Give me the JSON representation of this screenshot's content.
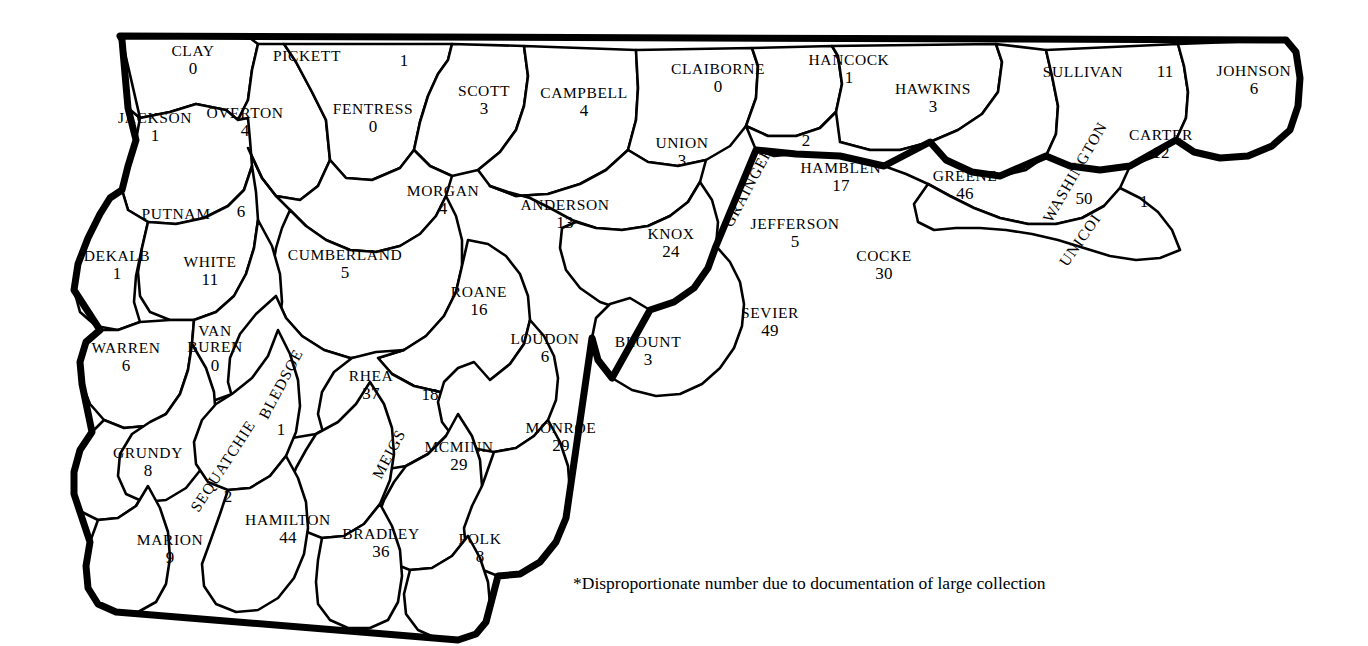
{
  "map": {
    "title_visible": false,
    "region": "East and Middle Tennessee counties",
    "footnote": "*Disproportionate number due to documentation of large collection",
    "colors": {
      "outline": "#000000",
      "county_border": "#000000",
      "fill": "#ffffff",
      "text": "#000000"
    },
    "counties": [
      {
        "name": "CLAY",
        "count": "0",
        "x": 193,
        "y": 60,
        "cx": 193,
        "cy": 83,
        "rotate": 0
      },
      {
        "name": "PICKETT",
        "count": "1",
        "x": 307,
        "y": 56,
        "cx": 404,
        "cy": 61,
        "rotate": 0,
        "split": true
      },
      {
        "name": "JACKSON",
        "count": "1",
        "x": 155,
        "y": 127,
        "cx": 155,
        "cy": 150,
        "rotate": 0
      },
      {
        "name": "OVERTON",
        "count": "4",
        "x": 245,
        "y": 122,
        "cx": 245,
        "cy": 145,
        "rotate": 0
      },
      {
        "name": "FENTRESS",
        "count": "0",
        "x": 373,
        "y": 118,
        "cx": 373,
        "cy": 141,
        "rotate": 0
      },
      {
        "name": "SCOTT",
        "count": "3",
        "x": 484,
        "y": 100,
        "cx": 484,
        "cy": 123,
        "rotate": 0
      },
      {
        "name": "CAMPBELL",
        "count": "4",
        "x": 584,
        "y": 102,
        "cx": 584,
        "cy": 125,
        "rotate": 0
      },
      {
        "name": "CLAIBORNE",
        "count": "0",
        "x": 718,
        "y": 78,
        "cx": 718,
        "cy": 101,
        "rotate": 0
      },
      {
        "name": "HANCOCK",
        "count": "1",
        "x": 849,
        "y": 69,
        "cx": 849,
        "cy": 92,
        "rotate": 0
      },
      {
        "name": "HAWKINS",
        "count": "3",
        "x": 933,
        "y": 98,
        "cx": 933,
        "cy": 121,
        "rotate": 0
      },
      {
        "name": "SULLIVAN",
        "count": "11",
        "x": 1083,
        "y": 72,
        "cx": 1165,
        "cy": 72,
        "rotate": 0,
        "split": true
      },
      {
        "name": "JOHNSON",
        "count": "6",
        "x": 1254,
        "y": 80,
        "cx": 1254,
        "cy": 103,
        "rotate": 0
      },
      {
        "name": "PUTNAM",
        "count": "6",
        "x": 176,
        "y": 214,
        "cx": 241,
        "cy": 212,
        "rotate": 0,
        "split": true
      },
      {
        "name": "UNION",
        "count": "3",
        "x": 682,
        "y": 152,
        "cx": 682,
        "cy": 175,
        "rotate": 0
      },
      {
        "name": "GRAINGER",
        "count": "2",
        "x": 748,
        "y": 187,
        "cx": 806,
        "cy": 141,
        "rotate": -62,
        "split": true
      },
      {
        "name": "HAMBLEN",
        "count": "17",
        "x": 841,
        "y": 177,
        "cx": 841,
        "cy": 198,
        "rotate": 0
      },
      {
        "name": "GREENE",
        "count": "46",
        "x": 965,
        "y": 185,
        "cx": 965,
        "cy": 208,
        "rotate": 0
      },
      {
        "name": "WASHINGTON",
        "count": "50",
        "x": 1075,
        "y": 172,
        "cx": 1084,
        "cy": 199,
        "rotate": -60,
        "split": true
      },
      {
        "name": "CARTER",
        "count": "12",
        "x": 1161,
        "y": 144,
        "cx": 1161,
        "cy": 167,
        "rotate": 0
      },
      {
        "name": "UNICOI",
        "count": "1",
        "x": 1080,
        "y": 240,
        "cx": 1144,
        "cy": 202,
        "rotate": -55,
        "split": true
      },
      {
        "name": "MORGAN",
        "count": "4",
        "x": 443,
        "y": 200,
        "cx": 443,
        "cy": 223,
        "rotate": 0
      },
      {
        "name": "ANDERSON",
        "count": "13",
        "x": 565,
        "y": 214,
        "cx": 565,
        "cy": 237,
        "rotate": 0
      },
      {
        "name": "KNOX",
        "count": "24",
        "x": 671,
        "y": 243,
        "cx": 671,
        "cy": 266,
        "rotate": 0
      },
      {
        "name": "JEFFERSON",
        "count": "5",
        "x": 795,
        "y": 233,
        "cx": 795,
        "cy": 256,
        "rotate": 0
      },
      {
        "name": "COCKE",
        "count": "30",
        "x": 884,
        "y": 265,
        "cx": 884,
        "cy": 288,
        "rotate": 0
      },
      {
        "name": "DEKALB",
        "count": "1",
        "x": 117,
        "y": 265,
        "cx": 117,
        "cy": 288,
        "rotate": 0
      },
      {
        "name": "WHITE",
        "count": "11",
        "x": 210,
        "y": 271,
        "cx": 210,
        "cy": 294,
        "rotate": 0
      },
      {
        "name": "CUMBERLAND",
        "count": "5",
        "x": 345,
        "y": 264,
        "cx": 345,
        "cy": 287,
        "rotate": 0
      },
      {
        "name": "ROANE",
        "count": "16",
        "x": 479,
        "y": 301,
        "cx": 479,
        "cy": 324,
        "rotate": 0
      },
      {
        "name": "SEVIER",
        "count": "49",
        "x": 770,
        "y": 322,
        "cx": 770,
        "cy": 345,
        "rotate": 0
      },
      {
        "name": "WARREN",
        "count": "6",
        "x": 126,
        "y": 357,
        "cx": 126,
        "cy": 380,
        "rotate": 0
      },
      {
        "name": "VAN BUREN",
        "count": "0",
        "x": 215,
        "y": 349,
        "cx": 215,
        "cy": 390,
        "rotate": 0,
        "two_line": true
      },
      {
        "name": "BLEDSOE",
        "count": "1",
        "x": 281,
        "y": 384,
        "cx": 281,
        "cy": 430,
        "rotate": -62,
        "split": true
      },
      {
        "name": "RHEA",
        "count": "37",
        "x": 371,
        "y": 385,
        "cx": 371,
        "cy": 408,
        "rotate": 0
      },
      {
        "name": "LOUDON",
        "count": "6",
        "x": 545,
        "y": 348,
        "cx": 545,
        "cy": 371,
        "rotate": 0
      },
      {
        "name": "BLOUNT",
        "count": "3",
        "x": 648,
        "y": 351,
        "cx": 648,
        "cy": 374,
        "rotate": 0
      },
      {
        "name": "MEIGS",
        "count": "18",
        "x": 389,
        "y": 454,
        "cx": 430,
        "cy": 395,
        "rotate": -62,
        "split": true
      },
      {
        "name": "McMINN",
        "count": "29",
        "x": 459,
        "y": 456,
        "cx": 459,
        "cy": 479,
        "rotate": 0
      },
      {
        "name": "MONROE",
        "count": "29",
        "x": 561,
        "y": 437,
        "cx": 561,
        "cy": 460,
        "rotate": 0
      },
      {
        "name": "SEQUATCHIE",
        "count": "2",
        "x": 223,
        "y": 466,
        "cx": 228,
        "cy": 497,
        "rotate": -57,
        "split": true
      },
      {
        "name": "GRUNDY",
        "count": "8",
        "x": 148,
        "y": 462,
        "cx": 148,
        "cy": 485,
        "rotate": 0
      },
      {
        "name": "HAMILTON",
        "count": "44",
        "x": 288,
        "y": 529,
        "cx": 288,
        "cy": 552,
        "rotate": 0
      },
      {
        "name": "BRADLEY",
        "count": "36",
        "x": 381,
        "y": 543,
        "cx": 381,
        "cy": 566,
        "rotate": 0
      },
      {
        "name": "POLK",
        "count": "8",
        "x": 480,
        "y": 548,
        "cx": 480,
        "cy": 571,
        "rotate": 0
      },
      {
        "name": "MARION",
        "count": "9",
        "x": 170,
        "y": 549,
        "cx": 170,
        "cy": 572,
        "rotate": 0
      }
    ],
    "footnote_pos": {
      "x": 573,
      "y": 573
    }
  }
}
